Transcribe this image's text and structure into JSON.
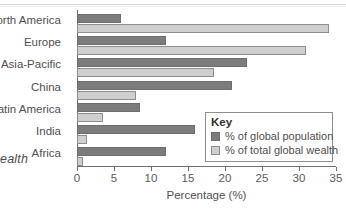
{
  "caption_fragment": "ealth",
  "legend": {
    "title": "Key",
    "entries": [
      {
        "label": "% of global population",
        "color": "#7c7c7c"
      },
      {
        "label": "% of total global wealth",
        "color": "#cfcfcf"
      }
    ]
  },
  "chart_data": {
    "type": "bar",
    "orientation": "horizontal",
    "title": "",
    "xlabel": "Percentage (%)",
    "ylabel": "",
    "xlim": [
      0,
      35
    ],
    "xticks": [
      0,
      5,
      10,
      15,
      20,
      25,
      30,
      35
    ],
    "xtick_labels": [
      "0",
      "5",
      "10",
      "15",
      "20",
      "25",
      "30",
      "35"
    ],
    "grid": false,
    "legend_position": "inside-bottom-right",
    "categories": [
      "North America",
      "Europe",
      "Asia-Pacific",
      "China",
      "Latin America",
      "India",
      "Africa"
    ],
    "series": [
      {
        "name": "% of global population",
        "color": "#7c7c7c",
        "values": [
          6,
          12,
          23,
          21,
          8.5,
          16,
          12
        ]
      },
      {
        "name": "% of total global wealth",
        "color": "#cfcfcf",
        "values": [
          34,
          31,
          18.5,
          8,
          3.5,
          1.3,
          0.8
        ]
      }
    ]
  }
}
